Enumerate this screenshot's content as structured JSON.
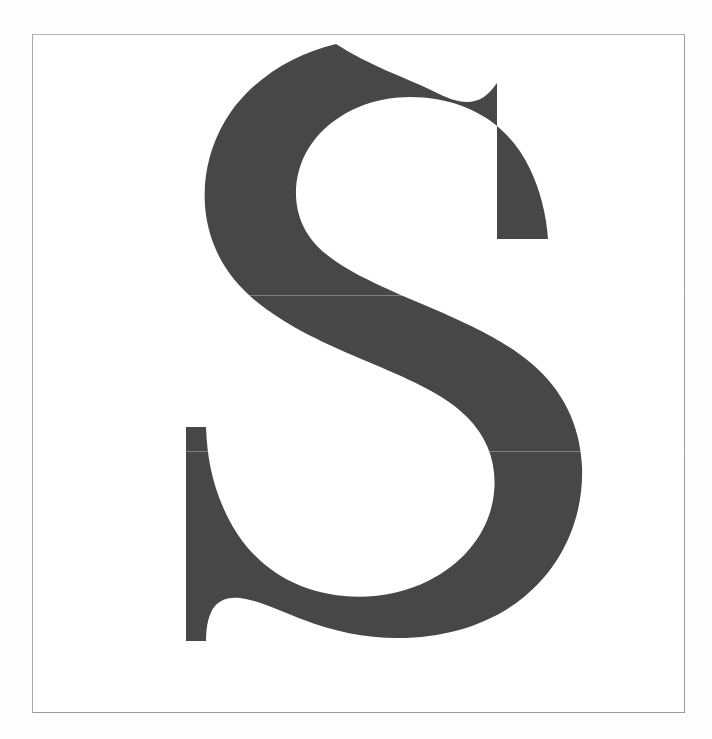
{
  "page": {
    "kind": "type-specimen-plate",
    "background_color": "#fdfdfd",
    "width": 712,
    "height": 739
  },
  "plate": {
    "name": "specimen-plate",
    "paper_color": "#ffffff",
    "rule_color": "#9b9b9b",
    "rule_width_px": 1,
    "left": 32,
    "top": 34,
    "width": 653,
    "height": 679
  },
  "glyph": {
    "character": "S",
    "name": "latin-capital-letter-s",
    "style": "didone-serif-capital",
    "fill_color": "#474747",
    "bounds": {
      "left": 185,
      "top": 67,
      "right": 524,
      "bottom": 665
    },
    "terminals": {
      "top_right": "flat-vertical-cut",
      "bottom_left": "flat-vertical-cut"
    },
    "path": "M 303.0 9.0 C 258.0 19.5 215.0 47.0 192.0 86.0 C 170.0 123.0 165.0 170.0 181.0 210.0 C 193.0 241.0 216.0 264.0 248.0 284.0 C 273.0 300.0 300.0 312.0 345.0 331.0 C 392.0 351.0 416.0 364.0 434.0 382.0 C 455.0 403.0 464.0 429.0 461.0 458.0 C 457.0 495.0 433.0 527.0 395.0 546.0 C 357.0 565.0 309.0 567.0 268.0 551.0 C 233.0 537.0 206.0 510.0 190.0 472.0 C 179.0 447.0 174.0 421.0 173.0 392.0 L 153.0 392.0 L 153.0 606.0 L 173.0 606.0 C 173.0 590.0 176.0 578.0 182.0 571.0 C 189.0 563.0 199.0 561.0 213.0 564.0 C 232.0 568.0 250.0 577.0 271.0 585.0 C 300.0 596.0 331.0 603.0 365.0 603.0 C 414.0 603.0 458.0 589.0 491.0 562.0 C 530.0 530.0 551.0 482.0 549.0 431.0 C 547.0 390.0 530.0 355.0 498.0 328.0 C 473.0 307.0 441.0 291.0 389.0 269.0 C 337.0 247.0 311.0 234.0 293.0 219.0 C 272.0 202.0 262.0 180.0 263.0 154.0 C 265.0 120.0 285.0 92.0 319.0 75.0 C 352.0 59.0 393.0 58.0 429.0 71.0 C 459.0 82.0 482.0 103.0 497.0 134.0 C 507.0 155.0 513.0 178.0 515.0 204.0 L 464.0 204.0 L 464.0 48.0 C 455.0 61.0 446.0 67.0 434.0 67.0 C 424.0 67.0 414.0 63.0 400.0 56.0 C 369.0 41.0 337.0 31.0 303.0 9.0 Z"
  },
  "artifacts": {
    "scan_seams": [
      {
        "name": "scan-seam-upper",
        "y": 260
      },
      {
        "name": "scan-seam-lower",
        "y": 416
      }
    ]
  },
  "caption": {
    "text": "S"
  }
}
